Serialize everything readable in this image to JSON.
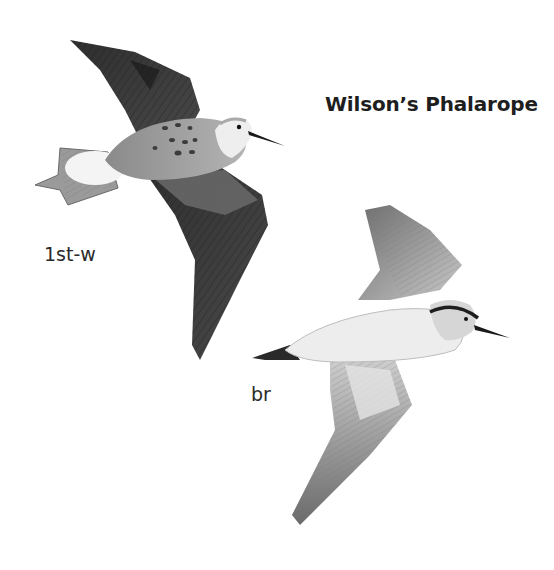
{
  "plate": {
    "title": "Wilson’s Phalarope",
    "figures": [
      {
        "id": "first-winter",
        "label": "1st-w",
        "view": "upperside in flight"
      },
      {
        "id": "breeding",
        "label": "br",
        "view": "underside in flight"
      }
    ],
    "colors": {
      "background": "#ffffff",
      "text": "#1e1e1e",
      "dark_wing": "#3a3a3a",
      "mid_gray": "#8c8c8c",
      "light_gray": "#cfcfcf"
    }
  }
}
